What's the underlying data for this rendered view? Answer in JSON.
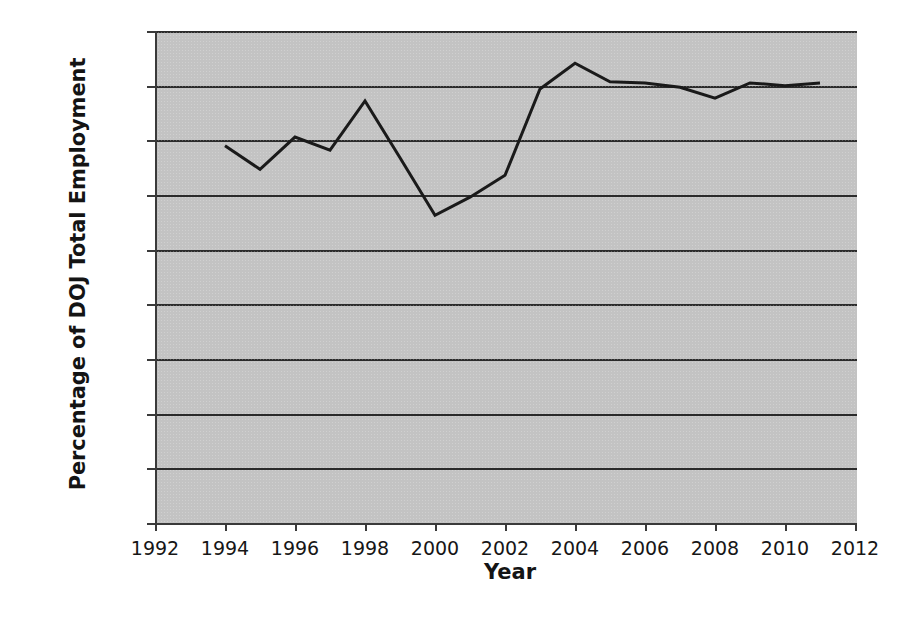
{
  "chart_data": {
    "type": "line",
    "title": "",
    "xlabel": "Year",
    "ylabel": "Percentage of DOJ Total Employment",
    "xlim": [
      1992,
      2012
    ],
    "ylim": [
      0,
      0.45
    ],
    "xticks": [
      1992,
      1994,
      1996,
      1998,
      2000,
      2002,
      2004,
      2006,
      2008,
      2010,
      2012
    ],
    "xtick_labels": [
      "1992",
      "1994",
      "1996",
      "1998",
      "2000",
      "2002",
      "2004",
      "2006",
      "2008",
      "2010",
      "2012"
    ],
    "yticks": [
      0,
      0.05,
      0.1,
      0.15,
      0.2,
      0.25,
      0.3,
      0.35,
      0.4,
      0.45
    ],
    "ytick_labels": [
      "0",
      "0.05",
      "0.1",
      "0.15",
      "0.2",
      "0.25",
      "0.3",
      "0.35",
      "0.4",
      "0.45"
    ],
    "grid": "horizontal",
    "legend": "none",
    "plot_background": "#c3c3c3",
    "line_color": "#1a1a1a",
    "line_width": 3,
    "x": [
      1994,
      1995,
      1996,
      1997,
      1998,
      1999,
      2000,
      2001,
      2002,
      2003,
      2004,
      2005,
      2006,
      2007,
      2008,
      2009,
      2010,
      2011
    ],
    "values": [
      0.345,
      0.3235,
      0.353,
      0.341,
      0.386,
      0.334,
      0.2815,
      0.298,
      0.318,
      0.397,
      0.4205,
      0.4035,
      0.4025,
      0.3985,
      0.3885,
      0.4025,
      0.4,
      0.4025
    ],
    "series": [
      {
        "name": "Percentage of DOJ Total Employment",
        "x": [
          1994,
          1995,
          1996,
          1997,
          1998,
          1999,
          2000,
          2001,
          2002,
          2003,
          2004,
          2005,
          2006,
          2007,
          2008,
          2009,
          2010,
          2011
        ],
        "values": [
          0.345,
          0.3235,
          0.353,
          0.341,
          0.386,
          0.334,
          0.2815,
          0.298,
          0.318,
          0.397,
          0.4205,
          0.4035,
          0.4025,
          0.3985,
          0.3885,
          0.4025,
          0.4,
          0.4025
        ]
      }
    ]
  }
}
